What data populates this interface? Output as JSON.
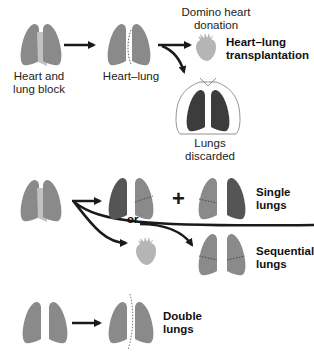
{
  "diagram": {
    "colors": {
      "lung": "#8a8a8a",
      "lung_dark": "#555555",
      "lung_darker": "#3c3c3c",
      "heart": "#b5b5b5",
      "heart_block": "#c2c2c2",
      "arrow": "#1a1a1a",
      "suture": "#333333"
    },
    "row1": {
      "heart_lung_block_label_line1": "Heart and",
      "heart_lung_block_label_line2": "lung block",
      "heart_lung_label": "Heart–lung",
      "domino_label_line1": "Domino heart",
      "domino_label_line2": "donation",
      "transplant_label_line1": "Heart–lung",
      "transplant_label_line2": "transplantation",
      "discarded_label": "Lungs discarded"
    },
    "row2": {
      "or_label": "or",
      "plus_label": "+",
      "single_label_line1": "Single",
      "single_label_line2": "lungs",
      "sequential_label_line1": "Sequential",
      "sequential_label_line2": "lungs"
    },
    "row3": {
      "double_label_line1": "Double",
      "double_label_line2": "lungs"
    }
  }
}
